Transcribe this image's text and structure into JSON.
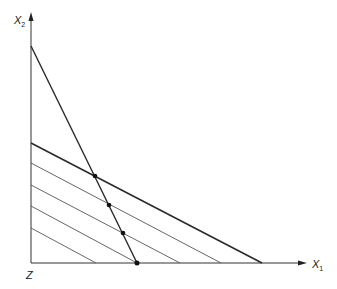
{
  "labels": {
    "y_axis": "X",
    "y_axis_sub": "2",
    "x_axis": "X",
    "x_axis_sub": "1",
    "origin": "Z"
  },
  "colors": {
    "axis": "#333333",
    "thick_line": "#2a2a2a",
    "thin_line": "#555555",
    "dot": "#111111"
  },
  "geometry": {
    "origin": [
      31,
      263
    ],
    "y_axis_top": [
      31,
      14
    ],
    "x_axis_end": [
      306,
      263
    ],
    "steep_line": [
      [
        31,
        46
      ],
      [
        137,
        263
      ]
    ],
    "thick_line": [
      [
        31,
        143
      ],
      [
        262,
        263
      ]
    ],
    "parallel_lines": [
      [
        [
          31,
          163
        ],
        [
          221,
          263
        ]
      ],
      [
        [
          31,
          185
        ],
        [
          180,
          263
        ]
      ],
      [
        [
          31,
          206
        ],
        [
          137,
          263
        ]
      ],
      [
        [
          31,
          228
        ],
        [
          96,
          263
        ]
      ]
    ],
    "dots": [
      [
        95,
        176
      ],
      [
        109,
        205
      ],
      [
        123,
        233
      ],
      [
        137,
        263
      ]
    ]
  }
}
